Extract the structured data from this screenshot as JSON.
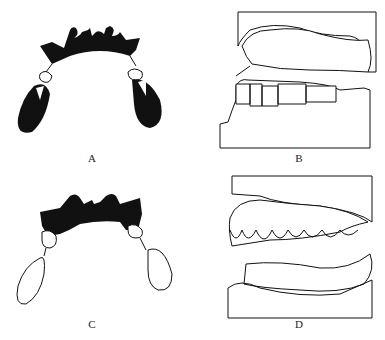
{
  "figure": {
    "panels": [
      {
        "id": "A",
        "label": "A",
        "description": "Occlusal view of removable partial denture framework with bilateral posterior extension (solid)"
      },
      {
        "id": "B",
        "label": "B",
        "description": "Lateral view of casts with upper edentulous ridge and lower dentition; arrow at ridge"
      },
      {
        "id": "C",
        "label": "C",
        "description": "Occlusal view of framework with outlined extension bases"
      },
      {
        "id": "D",
        "label": "D",
        "description": "Lateral view of casts with upper dentition and lower edentulous ridge"
      }
    ],
    "colors": {
      "ink": "#111111",
      "background": "#ffffff"
    }
  }
}
